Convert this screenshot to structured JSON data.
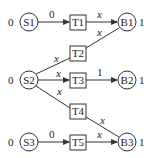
{
  "diagram": {
    "sources": [
      {
        "id": "S1",
        "label": "S1",
        "value": "0",
        "cx": 29,
        "cy": 22
      },
      {
        "id": "S2",
        "label": "S2",
        "value": "0",
        "cx": 29,
        "cy": 80
      },
      {
        "id": "S3",
        "label": "S3",
        "value": "0",
        "cx": 29,
        "cy": 142
      }
    ],
    "transitions": [
      {
        "id": "T1",
        "label": "T1",
        "x": 70,
        "y": 15
      },
      {
        "id": "T2",
        "label": "T2",
        "x": 70,
        "y": 46
      },
      {
        "id": "T3",
        "label": "T3",
        "x": 70,
        "y": 73
      },
      {
        "id": "T4",
        "label": "T4",
        "x": 70,
        "y": 106
      },
      {
        "id": "T5",
        "label": "T5",
        "x": 70,
        "y": 135
      }
    ],
    "sinks": [
      {
        "id": "B1",
        "label": "B1",
        "value": "1",
        "cx": 127,
        "cy": 22
      },
      {
        "id": "B2",
        "label": "B2",
        "value": "1",
        "cx": 127,
        "cy": 80
      },
      {
        "id": "B3",
        "label": "B3",
        "value": "1",
        "cx": 127,
        "cy": 142
      }
    ],
    "edges": [
      {
        "from": "S1",
        "to": "T1",
        "label": "0"
      },
      {
        "from": "T1",
        "to": "B1",
        "label": "x"
      },
      {
        "from": "T2",
        "to": "B1",
        "label": "x"
      },
      {
        "from": "S2",
        "to": "T2",
        "label": "x"
      },
      {
        "from": "S2",
        "to": "T3",
        "label": "x"
      },
      {
        "from": "T3",
        "to": "B2",
        "label": "1"
      },
      {
        "from": "S2",
        "to": "T4",
        "label": "x"
      },
      {
        "from": "T4",
        "to": "B3",
        "label": "x"
      },
      {
        "from": "S3",
        "to": "T5",
        "label": "0"
      },
      {
        "from": "T5",
        "to": "B3",
        "label": "x"
      }
    ]
  }
}
